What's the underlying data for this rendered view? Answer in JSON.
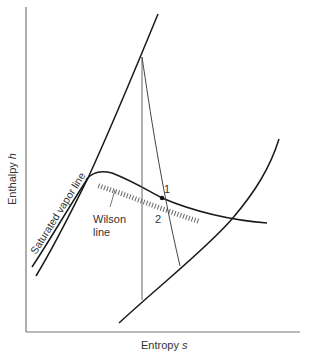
{
  "diagram": {
    "type": "h-s (Mollier) diagram",
    "xaxis": {
      "label": "Entropy ",
      "symbol": "s"
    },
    "yaxis": {
      "label": "Enthalpy ",
      "symbol": "h"
    },
    "labels": {
      "saturated_vapor_line": "Saturated vapor line",
      "wilson_line_1": "Wilson",
      "wilson_line_2": "line",
      "point_1": "1",
      "point_2": "2"
    },
    "colors": {
      "line": "#1a1a1a",
      "thin_line": "#555555",
      "axis": "#777777",
      "text": "#333333"
    }
  }
}
